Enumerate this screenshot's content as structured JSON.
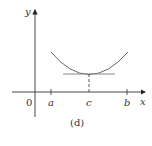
{
  "figure": {
    "caption": "(d)",
    "axes": {
      "x_label": "x",
      "y_label": "y",
      "origin_label": "0"
    },
    "ticks": [
      {
        "label": "a"
      },
      {
        "label": "c"
      },
      {
        "label": "b"
      }
    ],
    "elements": {
      "curve": "convex curve on [a, b] with minimum at c",
      "tangent": "horizontal tangent line at x = c",
      "guide": "dashed vertical line from curve minimum to x-axis at c"
    },
    "colors": {
      "axis": "#333333",
      "curve": "#666666",
      "tangent": "#888888"
    }
  }
}
